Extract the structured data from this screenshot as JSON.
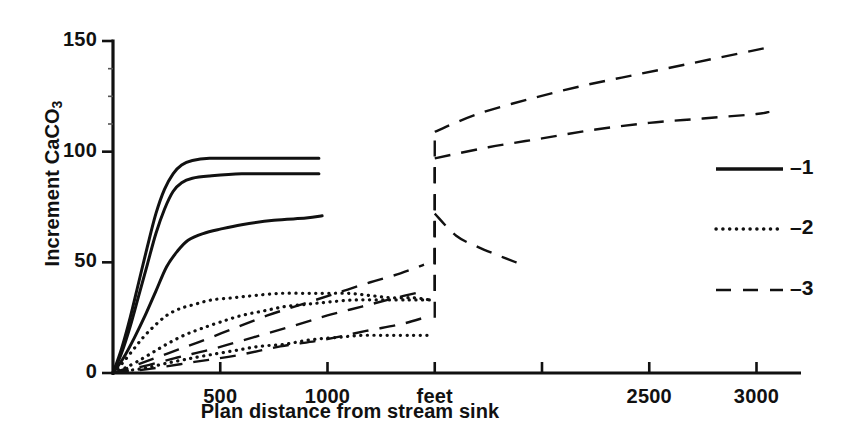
{
  "chart_data": {
    "type": "line",
    "title": "",
    "xlabel": "Plan distance from stream sink",
    "ylabel": "Increment CaCO3",
    "ylabel_display": "Increment CaCO",
    "ylabel_subscript": "3",
    "xunit_label": "feet",
    "xlim": [
      0,
      3200
    ],
    "ylim": [
      0,
      150
    ],
    "grid": false,
    "xticks": [
      500,
      1000,
      1500,
      2000,
      2500,
      3000
    ],
    "xtick_labels": [
      "500",
      "1000",
      "feet",
      "",
      "2500",
      "3000"
    ],
    "yticks": [
      0,
      50,
      100,
      150
    ],
    "ytick_labels": [
      "0",
      "50",
      "100",
      "150"
    ],
    "yminor_ticks": [
      112.5,
      125,
      137.5
    ],
    "legend_position": "right",
    "legend": [
      {
        "label": "1",
        "prefix": "–",
        "style": "solid"
      },
      {
        "label": "2",
        "prefix": "–",
        "style": "dotted"
      },
      {
        "label": "3",
        "prefix": "–",
        "style": "dashed"
      }
    ],
    "series": [
      {
        "name": "1a",
        "group": "1",
        "style": "solid",
        "points": [
          [
            0,
            0
          ],
          [
            40,
            11
          ],
          [
            80,
            25
          ],
          [
            120,
            41
          ],
          [
            160,
            57
          ],
          [
            200,
            72
          ],
          [
            240,
            83
          ],
          [
            280,
            90
          ],
          [
            320,
            94
          ],
          [
            370,
            96
          ],
          [
            450,
            97
          ],
          [
            600,
            97
          ],
          [
            800,
            97
          ],
          [
            960,
            97
          ]
        ]
      },
      {
        "name": "1b",
        "group": "1",
        "style": "solid",
        "points": [
          [
            0,
            0
          ],
          [
            40,
            9
          ],
          [
            80,
            21
          ],
          [
            120,
            35
          ],
          [
            160,
            49
          ],
          [
            200,
            63
          ],
          [
            240,
            74
          ],
          [
            280,
            82
          ],
          [
            320,
            86
          ],
          [
            370,
            88
          ],
          [
            450,
            89
          ],
          [
            600,
            90
          ],
          [
            800,
            90
          ],
          [
            960,
            90
          ]
        ]
      },
      {
        "name": "1c",
        "group": "1",
        "style": "solid",
        "points": [
          [
            0,
            0
          ],
          [
            50,
            7
          ],
          [
            100,
            16
          ],
          [
            150,
            26
          ],
          [
            200,
            37
          ],
          [
            250,
            48
          ],
          [
            300,
            55
          ],
          [
            350,
            60
          ],
          [
            420,
            63
          ],
          [
            500,
            65
          ],
          [
            600,
            67
          ],
          [
            750,
            69
          ],
          [
            900,
            70
          ],
          [
            975,
            71
          ]
        ]
      },
      {
        "name": "2a",
        "group": "2",
        "style": "dotted",
        "points": [
          [
            0,
            0
          ],
          [
            40,
            4
          ],
          [
            90,
            10
          ],
          [
            140,
            16
          ],
          [
            190,
            21
          ],
          [
            250,
            26
          ],
          [
            310,
            29
          ],
          [
            380,
            31
          ],
          [
            460,
            33
          ],
          [
            560,
            34
          ],
          [
            660,
            35
          ],
          [
            780,
            36
          ],
          [
            900,
            36
          ],
          [
            1000,
            36
          ],
          [
            1100,
            36
          ],
          [
            1200,
            35
          ],
          [
            1300,
            34
          ],
          [
            1400,
            34
          ],
          [
            1480,
            33
          ]
        ]
      },
      {
        "name": "2b",
        "group": "2",
        "style": "dotted",
        "points": [
          [
            0,
            0
          ],
          [
            50,
            2
          ],
          [
            110,
            5
          ],
          [
            180,
            9
          ],
          [
            250,
            13
          ],
          [
            330,
            17
          ],
          [
            410,
            20
          ],
          [
            500,
            23
          ],
          [
            600,
            26
          ],
          [
            700,
            28
          ],
          [
            800,
            30
          ],
          [
            900,
            31
          ],
          [
            1000,
            32
          ],
          [
            1120,
            33
          ],
          [
            1250,
            33
          ],
          [
            1380,
            33
          ],
          [
            1480,
            33
          ]
        ]
      },
      {
        "name": "2c",
        "group": "2",
        "style": "dotted",
        "points": [
          [
            0,
            0
          ],
          [
            60,
            1
          ],
          [
            140,
            2
          ],
          [
            230,
            4
          ],
          [
            330,
            6
          ],
          [
            440,
            8
          ],
          [
            560,
            10
          ],
          [
            680,
            12
          ],
          [
            800,
            13
          ],
          [
            920,
            15
          ],
          [
            1040,
            16
          ],
          [
            1160,
            17
          ],
          [
            1280,
            17
          ],
          [
            1400,
            17
          ],
          [
            1490,
            17
          ]
        ]
      },
      {
        "name": "3a",
        "group": "3",
        "style": "dashed",
        "points": [
          [
            0,
            0
          ],
          [
            120,
            4
          ],
          [
            260,
            9
          ],
          [
            400,
            14
          ],
          [
            560,
            20
          ],
          [
            720,
            26
          ],
          [
            880,
            31
          ],
          [
            1040,
            36
          ],
          [
            1200,
            41
          ],
          [
            1340,
            45
          ],
          [
            1450,
            49
          ]
        ],
        "jump": {
          "x": 1500,
          "from": 49,
          "to": 109
        },
        "post_points": [
          [
            1500,
            109
          ],
          [
            1700,
            117
          ],
          [
            1950,
            124
          ],
          [
            2200,
            130
          ],
          [
            2450,
            135
          ],
          [
            2700,
            140
          ],
          [
            2950,
            145
          ],
          [
            3050,
            147
          ]
        ]
      },
      {
        "name": "3b",
        "group": "3",
        "style": "dashed",
        "points": [
          [
            0,
            0
          ],
          [
            140,
            3
          ],
          [
            300,
            7
          ],
          [
            470,
            11
          ],
          [
            650,
            16
          ],
          [
            830,
            21
          ],
          [
            1000,
            26
          ],
          [
            1160,
            30
          ],
          [
            1320,
            34
          ],
          [
            1450,
            37
          ]
        ],
        "jump": {
          "x": 1500,
          "from": 37,
          "to": 97
        },
        "post_points": [
          [
            1500,
            97
          ],
          [
            1750,
            102
          ],
          [
            2000,
            106
          ],
          [
            2250,
            110
          ],
          [
            2500,
            113
          ],
          [
            2750,
            115
          ],
          [
            3000,
            117
          ],
          [
            3060,
            118
          ]
        ]
      },
      {
        "name": "3c",
        "group": "3",
        "style": "dashed",
        "points": [
          [
            0,
            0
          ],
          [
            180,
            2
          ],
          [
            380,
            5
          ],
          [
            580,
            8
          ],
          [
            780,
            12
          ],
          [
            980,
            15
          ],
          [
            1180,
            19
          ],
          [
            1340,
            22
          ],
          [
            1450,
            25
          ]
        ],
        "jump": {
          "x": 1500,
          "from": 25,
          "to": 72
        },
        "post_points": [
          [
            1500,
            72
          ],
          [
            1600,
            62
          ],
          [
            1700,
            57
          ],
          [
            1800,
            53
          ],
          [
            1880,
            50
          ],
          [
            1930,
            49
          ]
        ]
      }
    ]
  },
  "axes_geometry": {
    "x0_px": 113,
    "y0_px": 373,
    "x_per_unit": 0.2145,
    "y_per_unit": 2.2133
  }
}
